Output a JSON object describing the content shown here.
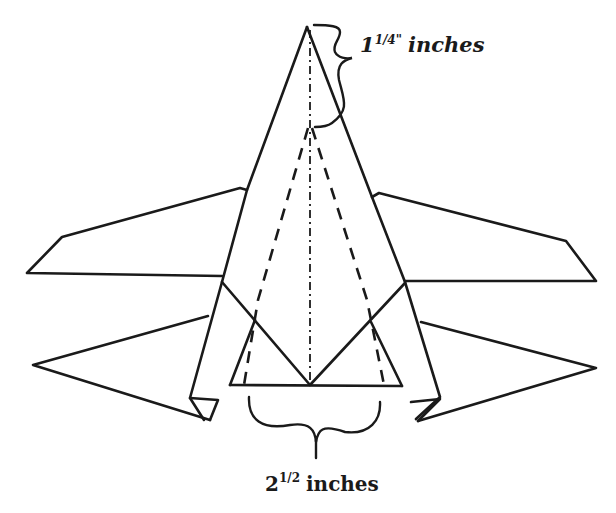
{
  "diagram": {
    "annotations": {
      "nose_length": {
        "whole": "1",
        "fraction": "1/4\"",
        "unit": "inches",
        "full_text": "1 1/4\" inches"
      },
      "base_width": {
        "whole": "2",
        "fraction": "1/2",
        "unit": "inches",
        "full_text": "2 1/2 inches"
      }
    },
    "line_styles": {
      "solid": "fold edge / outline",
      "dashed": "valley fold",
      "dash_dot": "center line"
    },
    "colors": {
      "ink": "#1a1a1a",
      "paper": "#ffffff"
    }
  }
}
